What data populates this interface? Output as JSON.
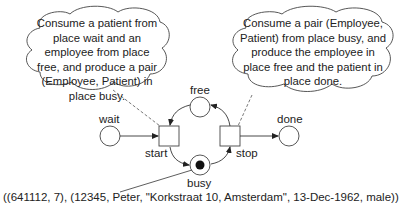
{
  "diagram": {
    "type": "petri-net",
    "places": [
      {
        "id": "wait",
        "label": "wait",
        "tokens": 0
      },
      {
        "id": "free",
        "label": "free",
        "tokens": 0
      },
      {
        "id": "busy",
        "label": "busy",
        "tokens": 1
      },
      {
        "id": "done",
        "label": "done",
        "tokens": 0
      }
    ],
    "transitions": [
      {
        "id": "start",
        "label": "start"
      },
      {
        "id": "stop",
        "label": "stop"
      }
    ],
    "arcs": [
      {
        "from": "wait",
        "to": "start"
      },
      {
        "from": "free",
        "to": "start"
      },
      {
        "from": "start",
        "to": "busy"
      },
      {
        "from": "busy",
        "to": "stop"
      },
      {
        "from": "stop",
        "to": "free"
      },
      {
        "from": "stop",
        "to": "done"
      }
    ],
    "annotations": {
      "start_callout": "Consume a patient from place wait and an employee from place free, and produce a pair (Employee, Patient) in place busy.",
      "stop_callout": "Consume a pair (Employee, Patient) from place busy, and produce the employee in place free and the patient in place done.",
      "busy_token_value": "((641112, 7), (12345, Peter, \"Korkstraat 10, Amsterdam\", 13-Dec-1962, male))"
    }
  }
}
